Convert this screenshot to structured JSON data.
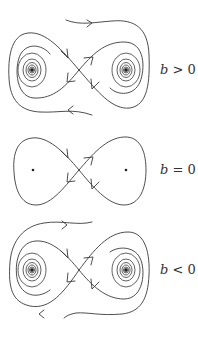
{
  "figure": {
    "panels": [
      {
        "id": "b-positive",
        "label_var": "b",
        "label_rel": " > 0",
        "saddle": [
          79,
          70
        ],
        "foci": [
          [
            32,
            70
          ],
          [
            126,
            70
          ]
        ],
        "type": "stable foci with separatrix wrapping right lobe from above and left lobe from below"
      },
      {
        "id": "b-zero",
        "label_var": "b",
        "label_rel": " = 0",
        "saddle": [
          79,
          170
        ],
        "centers": [
          [
            33,
            170
          ],
          [
            126,
            170
          ]
        ],
        "type": "homoclinic figure-eight"
      },
      {
        "id": "b-negative",
        "label_var": "b",
        "label_rel": " < 0",
        "saddle": [
          79,
          270
        ],
        "foci": [
          [
            32,
            270
          ],
          [
            126,
            270
          ]
        ],
        "type": "unstable foci with separatrix wrapping left lobe from above and right lobe from below"
      }
    ],
    "stroke_color": "#3a3a3a",
    "background": "#ffffff"
  }
}
